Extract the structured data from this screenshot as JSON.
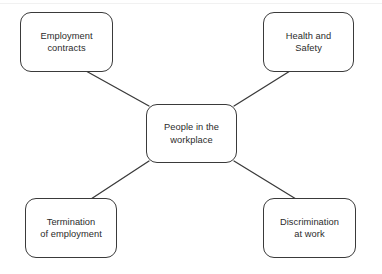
{
  "diagram": {
    "type": "mind-map",
    "title": "People in the workplace",
    "stroke_color": "#3a3a3a",
    "text_color": "#2b2b2b",
    "background_color": "#ffffff",
    "center": {
      "id": "center",
      "label": "People in the\nworkplace"
    },
    "nodes": [
      {
        "id": "employment-contracts",
        "label": "Employment\ncontracts"
      },
      {
        "id": "health-and-safety",
        "label": "Health and\nSafety"
      },
      {
        "id": "termination-of-employment",
        "label": "Termination\nof employment"
      },
      {
        "id": "discrimination-at-work",
        "label": "Discrimination\nat work"
      }
    ],
    "edges": [
      {
        "from": "employment-contracts",
        "to": "center"
      },
      {
        "from": "health-and-safety",
        "to": "center"
      },
      {
        "from": "termination-of-employment",
        "to": "center"
      },
      {
        "from": "discrimination-at-work",
        "to": "center"
      }
    ]
  }
}
